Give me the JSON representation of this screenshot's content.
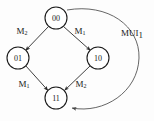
{
  "diagram": {
    "type": "state-transition-graph",
    "nodes": [
      {
        "id": "n00",
        "label": "00",
        "cx": 56,
        "cy": 18,
        "r": 11
      },
      {
        "id": "n01",
        "label": "01",
        "cx": 18,
        "cy": 58,
        "r": 11
      },
      {
        "id": "n10",
        "label": "10",
        "cx": 98,
        "cy": 58,
        "r": 11
      },
      {
        "id": "n11",
        "label": "11",
        "cx": 56,
        "cy": 98,
        "r": 11
      }
    ],
    "edges": [
      {
        "id": "e-00-01",
        "from": "00",
        "to": "01",
        "label_base": "M",
        "label_sub": "2"
      },
      {
        "id": "e-00-10",
        "from": "00",
        "to": "10",
        "label_base": "M",
        "label_sub": "1"
      },
      {
        "id": "e-01-11",
        "from": "01",
        "to": "11",
        "label_base": "M",
        "label_sub": "1"
      },
      {
        "id": "e-10-11",
        "from": "10",
        "to": "11",
        "label_base": "M",
        "label_sub": "2"
      },
      {
        "id": "e-00-11-arc",
        "from": "00",
        "to": "11",
        "label_base": "MUI",
        "label_sub": "1"
      }
    ],
    "labels": {
      "top_left": {
        "base": "M",
        "sub": "2"
      },
      "top_right": {
        "base": "M",
        "sub": "1"
      },
      "bottom_left": {
        "base": "M",
        "sub": "1"
      },
      "bottom_right": {
        "base": "M",
        "sub": "2"
      },
      "outer_arc": {
        "base": "MUI",
        "sub": "1"
      }
    },
    "colors": {
      "stroke": "#1a1a1a",
      "arc_stroke": "#555555",
      "node_fill": "#ffffff",
      "background": "#fdfdfd"
    }
  }
}
